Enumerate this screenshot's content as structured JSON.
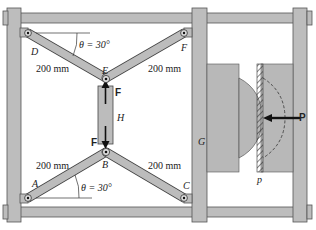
{
  "diagram": {
    "type": "mechanism",
    "points": {
      "A": "A",
      "B": "B",
      "C": "C",
      "D": "D",
      "E": "E",
      "F": "F"
    },
    "labels": {
      "angle_top": "θ = 30°",
      "angle_bottom": "θ = 30°",
      "length_DE": "200 mm",
      "length_EF": "200 mm",
      "length_AB": "200 mm",
      "length_BC": "200 mm",
      "hydraulic": "H",
      "frame_member": "G",
      "plate": "p",
      "force_top": "F",
      "force_bottom": "F",
      "force_P": "P"
    },
    "colors": {
      "member_fill": "#bcbcbc",
      "outline": "#444444",
      "background": "#ffffff",
      "text": "#222222"
    }
  }
}
